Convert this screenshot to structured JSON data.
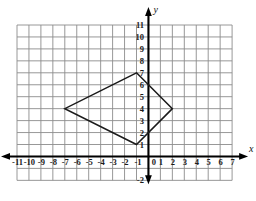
{
  "figure": {
    "type": "coordinate-plane-with-quadrilateral",
    "background": "#ffffff",
    "grid_color": "#8c8c8c",
    "axis_color": "#000000",
    "shape_color": "#1a1a1a"
  },
  "axes": {
    "x_label": "x",
    "y_label": "y",
    "x_min": -11,
    "x_max": 7,
    "y_min": -2,
    "y_max": 11,
    "x_tick_labels": [
      "-11",
      "-10",
      "-9",
      "-8",
      "-7",
      "-6",
      "-5",
      "-4",
      "-3",
      "-2",
      "-1",
      "0",
      "1",
      "2",
      "3",
      "4",
      "5",
      "6",
      "7"
    ],
    "y_tick_labels": [
      "11",
      "10",
      "9",
      "8",
      "7",
      "6",
      "5",
      "4",
      "3",
      "2",
      "1",
      "-1",
      "-2"
    ],
    "origin_label": "0"
  },
  "chart_data": {
    "type": "scatter",
    "title": "",
    "xlabel": "x",
    "ylabel": "y",
    "xlim": [
      -11,
      7
    ],
    "ylim": [
      -2,
      11
    ],
    "grid": true,
    "series": [
      {
        "name": "quadrilateral",
        "closed": true,
        "vertices": [
          {
            "x": -1,
            "y": 7
          },
          {
            "x": 2,
            "y": 4
          },
          {
            "x": -1,
            "y": 1
          },
          {
            "x": -7,
            "y": 4
          }
        ]
      }
    ]
  }
}
